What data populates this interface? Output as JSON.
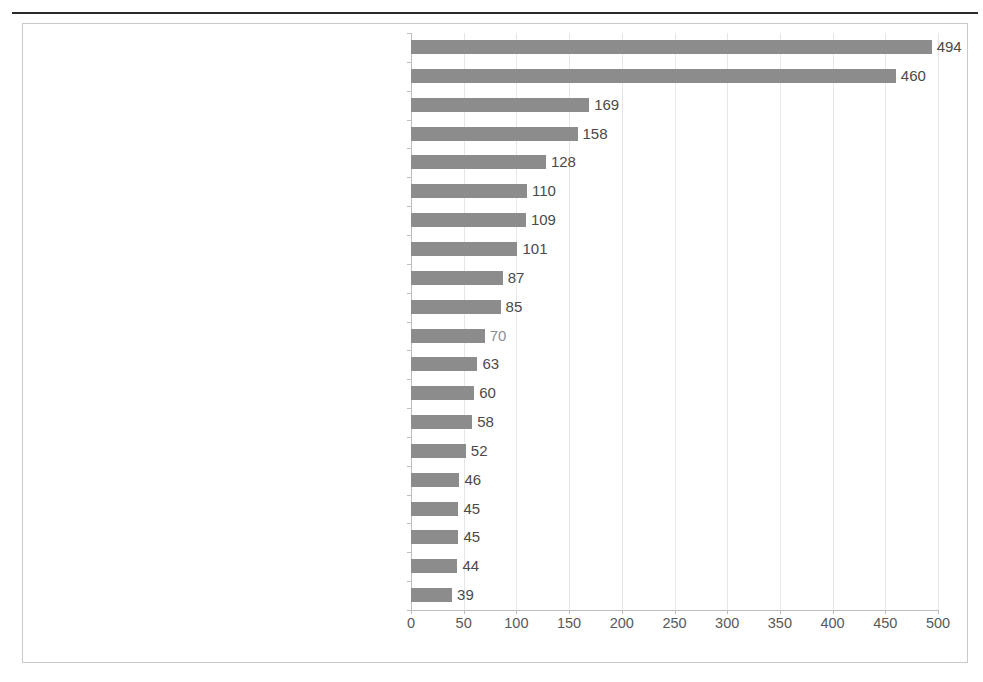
{
  "chart_data": {
    "type": "bar",
    "orientation": "horizontal",
    "title": "",
    "subtitle": "",
    "xlabel": "",
    "ylabel": "",
    "xlim": [
      0,
      500
    ],
    "xticks": [
      0,
      50,
      100,
      150,
      200,
      250,
      300,
      350,
      400,
      450,
      500
    ],
    "xtick_labels": [
      "0",
      "50",
      "100",
      "150",
      "200",
      "250",
      "300",
      "350",
      "400",
      "450",
      "500"
    ],
    "grid": true,
    "grid_axis": "x",
    "legend": false,
    "legend_position": "none",
    "bar_color": "#8c8c8c",
    "gridline_color": "#e6e6e6",
    "axis_color": "#bdbdbd",
    "text_color": "#58595b",
    "value_label_color": "#4a4a4a",
    "categories": [
      "European Journal of Operational Research",
      "Expert Systems with Applications",
      "International Journal of Production Economics",
      "Computers & Industrial Engineering",
      "Mathematical and Computer Modelling",
      "Computers & Operations Research",
      "Omega",
      "Decision Support Systems",
      "Journal of Environmental Management",
      "Fuzzy Sets and Systems",
      "Socio-Economic Planning Sciences",
      "Information Sciences",
      "Value in Health",
      "Energy Policy",
      "International Journal of Project Management",
      "Reliability Engineering & System Safety",
      "Environmental Modelling & Software",
      "Applied Mathematics and Computation",
      "Applied Soft Computing",
      "Fuel and Energy Abstracts"
    ],
    "values": [
      494,
      460,
      169,
      158,
      128,
      110,
      109,
      101,
      87,
      85,
      70,
      63,
      60,
      58,
      52,
      46,
      45,
      45,
      44,
      39
    ],
    "value_labels": [
      "494",
      "460",
      "169",
      "158",
      "128",
      "110",
      "109",
      "101",
      "87",
      "85",
      "70",
      "63",
      "60",
      "58",
      "52",
      "46",
      "45",
      "45",
      "44",
      "39"
    ]
  }
}
